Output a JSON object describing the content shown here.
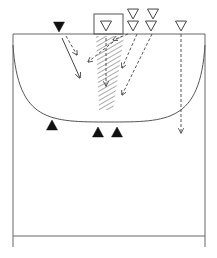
{
  "diagram": {
    "type": "handball-court-drill",
    "colors": {
      "line": "#555555",
      "attacker_fill": "#111111",
      "defender_fill": "#ffffff",
      "hatch": "#444444",
      "background": "#ffffff"
    },
    "court": {
      "left": 13,
      "right": 205,
      "goal_line_y": 34,
      "center_line_y": 236,
      "bottom_y": 247
    },
    "goal": {
      "x": 94,
      "y": 14,
      "w": 29,
      "h": 20
    },
    "goal_area_arc": {
      "left_y": 45,
      "bottom_y": 122
    },
    "players": {
      "attackers": [
        {
          "id": "a1",
          "x": 59,
          "y": 27,
          "dir": "down"
        },
        {
          "id": "a2",
          "x": 52,
          "y": 125,
          "dir": "up"
        },
        {
          "id": "a3",
          "x": 98,
          "y": 132,
          "dir": "up"
        },
        {
          "id": "a4",
          "x": 117,
          "y": 132,
          "dir": "up"
        }
      ],
      "defenders": [
        {
          "id": "d1",
          "x": 106,
          "y": 26,
          "label": "goalkeeper"
        },
        {
          "id": "d2",
          "x": 133,
          "y": 14
        },
        {
          "id": "d3",
          "x": 153,
          "y": 14
        },
        {
          "id": "d4",
          "x": 133,
          "y": 26
        },
        {
          "id": "d5",
          "x": 151,
          "y": 26
        },
        {
          "id": "d6",
          "x": 181,
          "y": 26
        }
      ]
    },
    "shaded_zone": {
      "points": "96,36 124,36 113,110 99,110"
    },
    "arrows": [
      {
        "id": "run1",
        "style": "solid",
        "x1": 62,
        "y1": 38,
        "x2": 80,
        "y2": 78
      },
      {
        "id": "pass1",
        "style": "dashed",
        "x1": 66,
        "y1": 36,
        "x2": 77,
        "y2": 55
      },
      {
        "id": "pass2",
        "style": "dashed",
        "x1": 128,
        "y1": 34,
        "x2": 113,
        "y2": 40
      },
      {
        "id": "pass3",
        "style": "dashed",
        "x1": 113,
        "y1": 42,
        "x2": 88,
        "y2": 62
      },
      {
        "id": "pass4",
        "style": "dashed",
        "x1": 106,
        "y1": 38,
        "x2": 106,
        "y2": 86
      },
      {
        "id": "pass5",
        "style": "dashed",
        "x1": 137,
        "y1": 34,
        "x2": 122,
        "y2": 68
      },
      {
        "id": "pass6",
        "style": "dashed",
        "x1": 152,
        "y1": 34,
        "x2": 122,
        "y2": 95
      },
      {
        "id": "pass7",
        "style": "dashed",
        "x1": 181,
        "y1": 34,
        "x2": 181,
        "y2": 133
      }
    ]
  }
}
